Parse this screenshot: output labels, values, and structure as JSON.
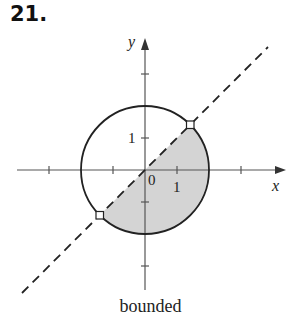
{
  "exercise": {
    "number": "21."
  },
  "diagram": {
    "axes": {
      "x_label": "x",
      "y_label": "y"
    },
    "labels": {
      "origin": "0",
      "x_tick": "1",
      "y_tick": "1"
    },
    "circle": {
      "equation": "x^2 + y^2 = 4",
      "style": "solid"
    },
    "line": {
      "equation": "y = x",
      "style": "dashed"
    },
    "shaded_region": "inside circle, below line y = x",
    "open_points": [
      "(√2, √2)",
      "(-√2, -√2)"
    ],
    "colors": {
      "shade": "#d4d4d4",
      "stroke": "#222222"
    }
  },
  "caption": "bounded"
}
